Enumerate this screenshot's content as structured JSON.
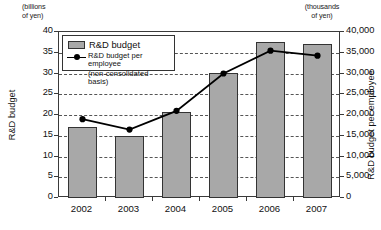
{
  "chart_data": {
    "type": "bar",
    "title": "",
    "categories": [
      "2002",
      "2003",
      "2004",
      "2005",
      "2006",
      "2007"
    ],
    "series": [
      {
        "name": "R&D budget",
        "type": "bar",
        "axis": "left",
        "unit": "billions of yen",
        "values": [
          17.0,
          15.0,
          20.7,
          30.2,
          37.5,
          37.0
        ]
      },
      {
        "name": "R&D budget per employee (non-consolidated basis)",
        "type": "line",
        "axis": "right",
        "unit": "thousands of yen",
        "values": [
          19000,
          16500,
          21000,
          30000,
          35500,
          34300
        ]
      }
    ],
    "xlabel": "",
    "ylabel": "R&D budget",
    "ylabel_right": "R&D budget per employee",
    "ylim": [
      0,
      40
    ],
    "ylim_right": [
      0,
      40000
    ],
    "yticks": [
      "0",
      "5",
      "10",
      "15",
      "20",
      "25",
      "30",
      "35",
      "40"
    ],
    "yticks_right": [
      "0",
      "5,000",
      "10,000",
      "15,000",
      "20,000",
      "25,000",
      "30,000",
      "35,000",
      "40,000"
    ],
    "grid": true,
    "legend_position": "upper-left"
  },
  "axes": {
    "left_unit_caption": "(billions\nof yen)",
    "right_unit_caption": "(thousands\nof yen)",
    "left_title": "R&D budget",
    "right_title": "R&D budget per employee"
  },
  "legend": {
    "bar_label": "R&D budget",
    "line_label": "R&D budget per employee",
    "line_sublabel": "(non-consolidated basis)"
  },
  "colors": {
    "bar_fill": "#a8a8a8",
    "bar_stroke": "#333333",
    "line": "#000000",
    "grid": "#555555",
    "frame": "#3a3a3a",
    "background": "#ffffff"
  }
}
